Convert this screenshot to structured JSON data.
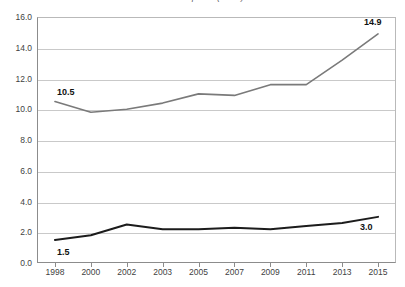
{
  "chart_data": {
    "type": "line",
    "title": "at 2007 prices (euros)",
    "xlabel": "",
    "ylabel": "",
    "ylim": [
      0.0,
      16.0
    ],
    "ytick_step": 2.0,
    "yticks": [
      "0.0",
      "2.0",
      "4.0",
      "6.0",
      "8.0",
      "10.0",
      "12.0",
      "14.0",
      "16.0"
    ],
    "grid": true,
    "legend": "none",
    "categories": [
      "1998",
      "2000",
      "2002",
      "2003",
      "2005",
      "2007",
      "2009",
      "2011",
      "2013",
      "2015"
    ],
    "series": [
      {
        "name": "upper-series",
        "color": "#7a7a7a",
        "width": 1.6,
        "values": [
          10.5,
          9.8,
          10.0,
          10.4,
          11.0,
          10.9,
          11.6,
          11.6,
          13.2,
          14.9
        ]
      },
      {
        "name": "lower-series",
        "color": "#1c1c1c",
        "width": 2.0,
        "values": [
          1.5,
          1.8,
          2.5,
          2.2,
          2.2,
          2.3,
          2.2,
          2.4,
          2.6,
          3.0
        ]
      }
    ],
    "annotations": [
      {
        "text": "10.5",
        "series": 0,
        "index": 0,
        "dx": 2,
        "dy": -14
      },
      {
        "text": "14.9",
        "series": 0,
        "index": 9,
        "dx": -14,
        "dy": -16
      },
      {
        "text": "1.5",
        "series": 1,
        "index": 0,
        "dx": 2,
        "dy": 8
      },
      {
        "text": "3.0",
        "series": 1,
        "index": 9,
        "dx": -18,
        "dy": 6
      }
    ]
  },
  "colors": {
    "grid": "#c9c9c9",
    "axis": "#8c8c8c",
    "text": "#3f3f3f",
    "label": "#111111"
  }
}
